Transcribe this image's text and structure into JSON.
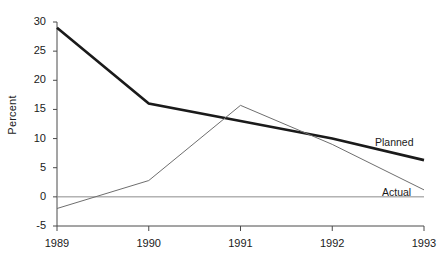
{
  "chart_data": {
    "type": "line",
    "title": "",
    "xlabel": "",
    "ylabel": "Percent",
    "categories": [
      "1989",
      "1990",
      "1991",
      "1992",
      "1993"
    ],
    "x": [
      1989,
      1990,
      1991,
      1992,
      1993
    ],
    "xlim": [
      1989,
      1993
    ],
    "ylim": [
      -5,
      30
    ],
    "yticks": [
      -5,
      0,
      5,
      10,
      15,
      20,
      25,
      30
    ],
    "ytick_labels": [
      "-5",
      "0",
      "5",
      "10",
      "15",
      "20",
      "25",
      "30"
    ],
    "xticks": [
      1989,
      1990,
      1991,
      1992,
      1993
    ],
    "xtick_labels": [
      "1989",
      "1990",
      "1991",
      "1992",
      "1993"
    ],
    "grid": false,
    "zero_reference_line": 0,
    "legend_position": "inline-end-of-line",
    "series": [
      {
        "name": "Planned",
        "values": [
          29,
          16,
          13,
          10,
          6.3
        ],
        "color": "#1a1a1a",
        "line_width": 2.6
      },
      {
        "name": "Actual",
        "values": [
          -2,
          2.8,
          15.7,
          9,
          1.2
        ],
        "color": "#6e6e6e",
        "line_width": 1
      }
    ]
  },
  "axis": {
    "y_axis_label": "Percent",
    "baseline_value": -5
  },
  "labels": {
    "planned": "Planned",
    "actual": "Actual"
  }
}
